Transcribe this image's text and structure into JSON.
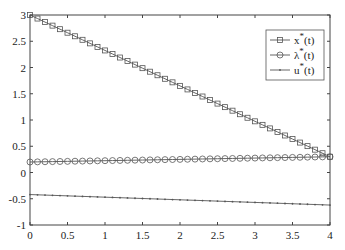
{
  "chart_data": {
    "type": "line",
    "title": "",
    "xlabel": "",
    "ylabel": "",
    "xlim": [
      0,
      4
    ],
    "ylim": [
      -1,
      3
    ],
    "grid": false,
    "legend_position": "upper right (inside)",
    "xticks": [
      "0",
      "0.5",
      "1",
      "1.5",
      "2",
      "2.5",
      "3",
      "3.5",
      "4"
    ],
    "yticks": [
      "-1",
      "-0.5",
      "0",
      "0.5",
      "1",
      "1.5",
      "2",
      "2.5",
      "3"
    ],
    "x": [
      0,
      0.1,
      0.2,
      0.3,
      0.4,
      0.5,
      0.6,
      0.7,
      0.8,
      0.9,
      1.0,
      1.1,
      1.2,
      1.3,
      1.4,
      1.5,
      1.6,
      1.7,
      1.8,
      1.9,
      2.0,
      2.1,
      2.2,
      2.3,
      2.4,
      2.5,
      2.6,
      2.7,
      2.8,
      2.9,
      3.0,
      3.1,
      3.2,
      3.3,
      3.4,
      3.5,
      3.6,
      3.7,
      3.8,
      3.9,
      4.0
    ],
    "series": [
      {
        "name": "x*(t)",
        "marker": "square",
        "start": 3.0,
        "end": 0.3
      },
      {
        "name": "λ*(t)",
        "marker": "circle",
        "start": 0.2,
        "end": 0.3
      },
      {
        "name": "u*(t)",
        "marker": "point",
        "start": -0.42,
        "end": -0.62
      }
    ]
  },
  "legend": {
    "items": [
      {
        "base": "x",
        "sup": "*",
        "arg": "(t)"
      },
      {
        "base": "λ",
        "sup": "*",
        "arg": "(t)"
      },
      {
        "base": "u",
        "sup": "*",
        "arg": "(t)"
      }
    ]
  },
  "colors": {
    "line": "#555555",
    "axis": "#333333"
  }
}
